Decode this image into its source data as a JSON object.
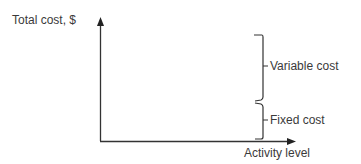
{
  "diagram": {
    "y_axis_label": "Total cost, $",
    "x_axis_label": "Activity level",
    "brackets": [
      {
        "label": "Variable cost"
      },
      {
        "label": "Fixed cost"
      }
    ]
  }
}
